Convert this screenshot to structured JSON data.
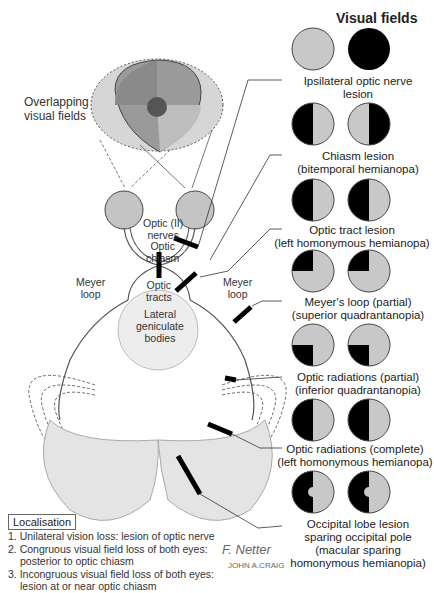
{
  "header": {
    "title": "Visual fields"
  },
  "overlap_label": [
    "Overlapping",
    "visual fields"
  ],
  "anatomy_labels": {
    "optic_nerves": [
      "Optic (II)",
      "nerves"
    ],
    "optic_chiasm": [
      "Optic",
      "chiasm"
    ],
    "optic_tracts": [
      "Optic",
      "tracts"
    ],
    "meyer_loop_left": [
      "Meyer",
      "loop"
    ],
    "meyer_loop_right": [
      "Meyer",
      "loop"
    ],
    "lgb": [
      "Lateral",
      "geniculate",
      "bodies"
    ]
  },
  "lesions": [
    {
      "label": [
        "Ipsilateral optic nerve",
        "lesion"
      ],
      "left_field": "normal",
      "right_field": "blind"
    },
    {
      "label": [
        "Chiasm lesion",
        "(bitemporal hemianopa)"
      ],
      "left_field": "left-half-blind",
      "right_field": "right-half-blind"
    },
    {
      "label": [
        "Optic tract lesion",
        "(left homonymous hemianopa)"
      ],
      "left_field": "left-half-blind",
      "right_field": "left-half-blind"
    },
    {
      "label": [
        "Meyer's loop (partial)",
        "(superior quadrantanopia)"
      ],
      "left_field": "upper-left-quadrant",
      "right_field": "upper-left-quadrant"
    },
    {
      "label": [
        "Optic radiations (partial)",
        "(inferior quadrantanopia)"
      ],
      "left_field": "lower-left-quadrant",
      "right_field": "lower-left-quadrant"
    },
    {
      "label": [
        "Optic radiations (complete)",
        "(left homonymous hemianopa)"
      ],
      "left_field": "left-half-blind",
      "right_field": "left-half-blind"
    },
    {
      "label": [
        "Occipital lobe lesion",
        "sparing occipital pole",
        "(macular sparing",
        "homonymous hemianopia)"
      ],
      "left_field": "left-half-macular-sparing",
      "right_field": "left-half-macular-sparing"
    }
  ],
  "localisation": {
    "title": "Localisation",
    "items": [
      [
        "1. Unilateral vision loss: lesion of optic nerve"
      ],
      [
        "2. Congruous visual field loss of both eyes:",
        "posterior to optic chiasm"
      ],
      [
        "3. Incongruous visual field loss of both eyes:",
        "lesion at or near optic chiasm"
      ]
    ]
  },
  "signature": [
    "F. Netter",
    "JOHN A.CRAIG"
  ],
  "colors": {
    "field_gray": "#c8c8c8",
    "blind": "#000000",
    "brain": "#e2e2e2"
  }
}
